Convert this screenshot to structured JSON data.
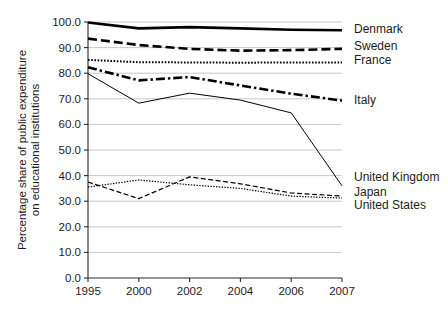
{
  "chart_data": {
    "type": "line",
    "title": "",
    "xlabel": "",
    "ylabel": "Percentage share of public expenditure on educational institutions",
    "ylabel_line1": "Percentage share of public expenditure",
    "ylabel_line2": "on educational institutions",
    "categories": [
      "1995",
      "2000",
      "2002",
      "2004",
      "2006",
      "2007"
    ],
    "ylim": [
      0,
      100
    ],
    "ytick_values": [
      0,
      10,
      20,
      30,
      40,
      50,
      60,
      70,
      80,
      90,
      100
    ],
    "ytick_labels": [
      "0.0",
      "10.0",
      "20.0",
      "30.0",
      "40.0",
      "50.0",
      "60.0",
      "70.0",
      "80.0",
      "90.0",
      "100.0"
    ],
    "grid": true,
    "legend_position": "right-inline",
    "series": [
      {
        "name": "Denmark",
        "values": [
          99.8,
          97.5,
          98.0,
          97.5,
          97.0,
          96.8
        ],
        "style": "solid",
        "width": 2.6,
        "dash": "none",
        "label_y": 96.8
      },
      {
        "name": "Sweden",
        "values": [
          93.5,
          91.0,
          89.5,
          88.8,
          89.0,
          89.5
        ],
        "style": "dashed",
        "width": 2.6,
        "dash": "9,4",
        "label_y": 90.2
      },
      {
        "name": "France",
        "values": [
          85.2,
          84.3,
          84.2,
          84.1,
          84.2,
          84.2
        ],
        "style": "dotted",
        "width": 2.0,
        "dash": "1.6,1.6",
        "label_y": 85.0
      },
      {
        "name": "Italy",
        "values": [
          82.3,
          77.2,
          78.5,
          75.2,
          72.0,
          69.3
        ],
        "style": "dash-dot",
        "width": 2.6,
        "dash": "9,3,2.4,3",
        "label_y": 69.3
      },
      {
        "name": "United Kingdom",
        "values": [
          79.8,
          68.3,
          72.2,
          69.5,
          64.5,
          36.0
        ],
        "style": "solid-thin",
        "width": 1.0,
        "dash": "none",
        "label_y": 39.0
      },
      {
        "name": "Japan",
        "values": [
          37.5,
          31.0,
          39.5,
          36.8,
          33.2,
          32.0
        ],
        "style": "dashed-thin",
        "width": 1.2,
        "dash": "5,2.5",
        "label_y": 33.2
      },
      {
        "name": "United States",
        "values": [
          35.5,
          38.3,
          36.4,
          35.0,
          32.0,
          31.2
        ],
        "style": "dotted-thin",
        "width": 1.2,
        "dash": "1.4,1.4",
        "label_y": 28.0
      }
    ],
    "colors": {
      "line": "#000000",
      "grid": "#b9b9b9",
      "axis": "#2a2a2a",
      "text": "#1d1d1d",
      "background": "#ffffff"
    }
  },
  "plot_geometry": {
    "left": 88,
    "right": 342,
    "top": 22,
    "bottom": 278
  }
}
